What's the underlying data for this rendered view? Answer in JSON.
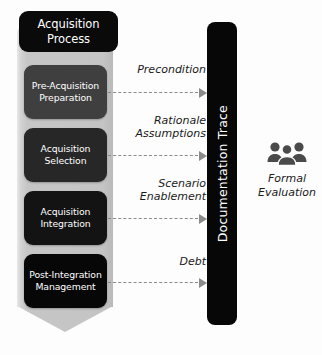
{
  "process": {
    "header": "Acquisition\nProcess",
    "stages": [
      {
        "label": "Pre-Acquisition\nPreparation"
      },
      {
        "label": "Acquisition\nSelection"
      },
      {
        "label": "Acquisition\nIntegration"
      },
      {
        "label": "Post-Integration\nManagement"
      }
    ]
  },
  "flows": [
    {
      "label": "Precondition"
    },
    {
      "label": "Rationale\nAssumptions"
    },
    {
      "label": "Scenario\nEnablement"
    },
    {
      "label": "Debt"
    }
  ],
  "trace": {
    "label": "Documentation Trace"
  },
  "evaluation": {
    "icon": "people-group-icon",
    "label": "Formal\nEvaluation"
  },
  "colors": {
    "column": "#c4c4c4",
    "header": "#0a0a0a",
    "stage_1": "#3f3f3f",
    "stage_2": "#272727",
    "stage_3": "#131313",
    "stage_4": "#070707",
    "arrow": "#8a8a8a",
    "trace_bar": "#070707",
    "icon": "#4a4a4a",
    "background": "#fdfdfd"
  }
}
